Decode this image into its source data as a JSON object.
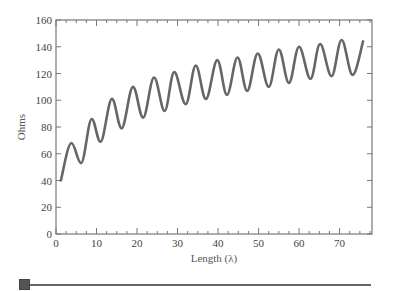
{
  "chart_data": {
    "type": "line",
    "title": "",
    "xlabel": "Length (λ)",
    "ylabel": "Ohms",
    "xlim": [
      0,
      78
    ],
    "ylim": [
      0,
      160
    ],
    "xticks": [
      0,
      10,
      20,
      30,
      40,
      50,
      60,
      70
    ],
    "yticks": [
      0,
      20,
      40,
      60,
      80,
      100,
      120,
      140,
      160
    ],
    "x_minor_step": 2.5,
    "grid": false,
    "legend": null,
    "series": [
      {
        "name": "Impedance",
        "color": "#666666",
        "x": [
          1.2,
          3.8,
          6.2,
          8.8,
          11,
          13.8,
          16.2,
          19,
          21.5,
          24.2,
          26.8,
          29.2,
          32,
          34.5,
          37,
          39.8,
          42.2,
          44.8,
          47.2,
          49.8,
          52.5,
          55,
          57.5,
          60,
          62.8,
          65.2,
          68,
          70.5,
          73.2,
          75.8
        ],
        "y": [
          40,
          68,
          53,
          86,
          69,
          101,
          79,
          110,
          87,
          117,
          92,
          121,
          97,
          126,
          101,
          130,
          104,
          132,
          107,
          135,
          110,
          138,
          113,
          140,
          116,
          142,
          118,
          145,
          119,
          144
        ]
      }
    ]
  },
  "slider": {
    "value": 0,
    "label": ""
  }
}
